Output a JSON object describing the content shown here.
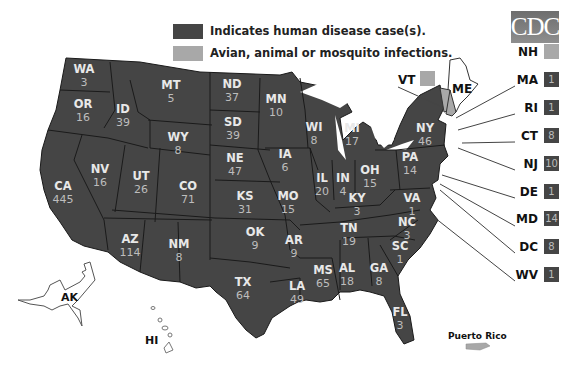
{
  "title_logo": "CDC",
  "colors": {
    "human": "#454545",
    "animal": "#a8a8a8",
    "background": "#ffffff"
  },
  "legend": [
    {
      "label": "Indicates human disease case(s).",
      "color": "#454545"
    },
    {
      "label": "Avian, animal or mosquito infections.",
      "color": "#a8a8a8"
    }
  ],
  "states": [
    {
      "abbr": "WA",
      "count": "3",
      "x": 84,
      "y": 73
    },
    {
      "abbr": "OR",
      "count": "16",
      "x": 83,
      "y": 108
    },
    {
      "abbr": "ID",
      "count": "39",
      "x": 123,
      "y": 113
    },
    {
      "abbr": "MT",
      "count": "5",
      "x": 171,
      "y": 89
    },
    {
      "abbr": "WY",
      "count": "8",
      "x": 178,
      "y": 141
    },
    {
      "abbr": "NV",
      "count": "16",
      "x": 100,
      "y": 173
    },
    {
      "abbr": "UT",
      "count": "26",
      "x": 141,
      "y": 180
    },
    {
      "abbr": "CO",
      "count": "71",
      "x": 188,
      "y": 190
    },
    {
      "abbr": "CA",
      "count": "445",
      "x": 63,
      "y": 190
    },
    {
      "abbr": "AZ",
      "count": "114",
      "x": 130,
      "y": 243
    },
    {
      "abbr": "NM",
      "count": "8",
      "x": 179,
      "y": 248
    },
    {
      "abbr": "ND",
      "count": "37",
      "x": 232,
      "y": 88
    },
    {
      "abbr": "SD",
      "count": "39",
      "x": 233,
      "y": 126
    },
    {
      "abbr": "NE",
      "count": "47",
      "x": 235,
      "y": 162
    },
    {
      "abbr": "KS",
      "count": "31",
      "x": 245,
      "y": 200
    },
    {
      "abbr": "OK",
      "count": "9",
      "x": 255,
      "y": 236
    },
    {
      "abbr": "TX",
      "count": "64",
      "x": 243,
      "y": 286
    },
    {
      "abbr": "MN",
      "count": "10",
      "x": 276,
      "y": 103
    },
    {
      "abbr": "IA",
      "count": "6",
      "x": 285,
      "y": 158
    },
    {
      "abbr": "MO",
      "count": "15",
      "x": 288,
      "y": 200
    },
    {
      "abbr": "AR",
      "count": "9",
      "x": 294,
      "y": 244
    },
    {
      "abbr": "LA",
      "count": "49",
      "x": 297,
      "y": 290
    },
    {
      "abbr": "WI",
      "count": "8",
      "x": 314,
      "y": 131
    },
    {
      "abbr": "IL",
      "count": "20",
      "x": 322,
      "y": 182
    },
    {
      "abbr": "MS",
      "count": "65",
      "x": 323,
      "y": 274
    },
    {
      "abbr": "MI",
      "count": "17",
      "x": 352,
      "y": 132
    },
    {
      "abbr": "IN",
      "count": "4",
      "x": 343,
      "y": 182
    },
    {
      "abbr": "KY",
      "count": "3",
      "x": 357,
      "y": 202
    },
    {
      "abbr": "TN",
      "count": "19",
      "x": 349,
      "y": 232
    },
    {
      "abbr": "AL",
      "count": "18",
      "x": 347,
      "y": 272
    },
    {
      "abbr": "GA",
      "count": "8",
      "x": 379,
      "y": 272
    },
    {
      "abbr": "OH",
      "count": "15",
      "x": 370,
      "y": 174
    },
    {
      "abbr": "FL",
      "count": "3",
      "x": 400,
      "y": 316
    },
    {
      "abbr": "SC",
      "count": "1",
      "x": 400,
      "y": 250
    },
    {
      "abbr": "NC",
      "count": "3",
      "x": 407,
      "y": 226
    },
    {
      "abbr": "VA",
      "count": "1",
      "x": 412,
      "y": 202
    },
    {
      "abbr": "PA",
      "count": "14",
      "x": 410,
      "y": 161
    },
    {
      "abbr": "NY",
      "count": "46",
      "x": 425,
      "y": 132
    }
  ],
  "side_states": [
    {
      "abbr": "NH",
      "count": "",
      "type": "animal",
      "y": 52
    },
    {
      "abbr": "MA",
      "count": "1",
      "type": "human",
      "y": 80
    },
    {
      "abbr": "RI",
      "count": "1",
      "type": "human",
      "y": 108
    },
    {
      "abbr": "CT",
      "count": "8",
      "type": "human",
      "y": 136
    },
    {
      "abbr": "NJ",
      "count": "10",
      "type": "human",
      "y": 164
    },
    {
      "abbr": "DE",
      "count": "1",
      "type": "human",
      "y": 192
    },
    {
      "abbr": "MD",
      "count": "14",
      "type": "human",
      "y": 219
    },
    {
      "abbr": "DC",
      "count": "8",
      "type": "human",
      "y": 247
    },
    {
      "abbr": "WV",
      "count": "1",
      "type": "human",
      "y": 275
    }
  ],
  "vt": {
    "abbr": "VT",
    "type": "animal"
  },
  "me": {
    "abbr": "ME",
    "type": "none"
  },
  "territories": {
    "ak": "AK",
    "hi": "HI",
    "pr": "Puerto Rico"
  }
}
